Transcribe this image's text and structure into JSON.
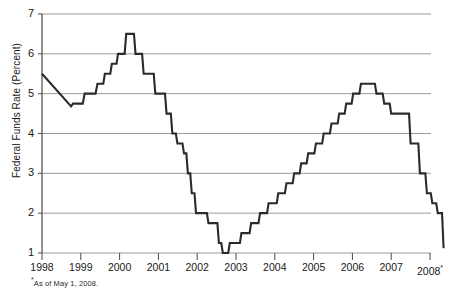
{
  "chart_data": {
    "type": "line",
    "title": "",
    "subtitle": "",
    "xlabel": "",
    "ylabel": "Federal Funds Rate (Percent)",
    "xlim": [
      1998.0,
      2008.35
    ],
    "ylim": [
      1,
      7
    ],
    "ytick_labels": [
      "1",
      "2",
      "3",
      "4",
      "5",
      "6",
      "7"
    ],
    "ytick_values": [
      1,
      2,
      3,
      4,
      5,
      6,
      7
    ],
    "xtick_labels": [
      "1998",
      "1999",
      "2000",
      "2001",
      "2002",
      "2003",
      "2004",
      "2005",
      "2006",
      "2007",
      "2008"
    ],
    "xtick_values": [
      1998,
      1999,
      2000,
      2001,
      2002,
      2003,
      2004,
      2005,
      2006,
      2007,
      2008
    ],
    "xtick_last_superscript": "*",
    "grid": "horizontal",
    "legend": "none",
    "line_color": "#2b2b2b",
    "grid_color": "#9a9a9a",
    "axis_color": "#4a4a4a",
    "background": "#ffffff",
    "step_style": "post",
    "footnote": "As of May 1, 2008.",
    "footnote_marker": "*",
    "series": [
      {
        "name": "Federal Funds Rate",
        "points": [
          {
            "x": 1998.0,
            "y": 5.5
          },
          {
            "x": 1998.75,
            "y": 4.68
          },
          {
            "x": 1998.8,
            "y": 4.75
          },
          {
            "x": 1999.05,
            "y": 4.75
          },
          {
            "x": 1999.1,
            "y": 5.0
          },
          {
            "x": 1999.38,
            "y": 5.0
          },
          {
            "x": 1999.43,
            "y": 5.25
          },
          {
            "x": 1999.58,
            "y": 5.25
          },
          {
            "x": 1999.62,
            "y": 5.5
          },
          {
            "x": 1999.76,
            "y": 5.5
          },
          {
            "x": 1999.8,
            "y": 5.75
          },
          {
            "x": 1999.92,
            "y": 5.75
          },
          {
            "x": 1999.96,
            "y": 6.0
          },
          {
            "x": 2000.13,
            "y": 6.0
          },
          {
            "x": 2000.17,
            "y": 6.5
          },
          {
            "x": 2000.37,
            "y": 6.5
          },
          {
            "x": 2000.41,
            "y": 6.0
          },
          {
            "x": 2000.58,
            "y": 6.0
          },
          {
            "x": 2000.62,
            "y": 5.5
          },
          {
            "x": 2000.88,
            "y": 5.5
          },
          {
            "x": 2000.92,
            "y": 5.0
          },
          {
            "x": 2001.17,
            "y": 5.0
          },
          {
            "x": 2001.21,
            "y": 4.5
          },
          {
            "x": 2001.32,
            "y": 4.5
          },
          {
            "x": 2001.36,
            "y": 4.0
          },
          {
            "x": 2001.45,
            "y": 4.0
          },
          {
            "x": 2001.49,
            "y": 3.75
          },
          {
            "x": 2001.62,
            "y": 3.75
          },
          {
            "x": 2001.66,
            "y": 3.5
          },
          {
            "x": 2001.72,
            "y": 3.5
          },
          {
            "x": 2001.76,
            "y": 3.0
          },
          {
            "x": 2001.82,
            "y": 3.0
          },
          {
            "x": 2001.86,
            "y": 2.5
          },
          {
            "x": 2001.93,
            "y": 2.5
          },
          {
            "x": 2001.97,
            "y": 2.0
          },
          {
            "x": 2002.25,
            "y": 2.0
          },
          {
            "x": 2002.29,
            "y": 1.75
          },
          {
            "x": 2002.52,
            "y": 1.75
          },
          {
            "x": 2002.56,
            "y": 1.25
          },
          {
            "x": 2002.62,
            "y": 1.25
          },
          {
            "x": 2002.66,
            "y": 1.0
          },
          {
            "x": 2002.8,
            "y": 1.0
          },
          {
            "x": 2002.84,
            "y": 1.25
          },
          {
            "x": 2003.1,
            "y": 1.25
          },
          {
            "x": 2003.14,
            "y": 1.5
          },
          {
            "x": 2003.35,
            "y": 1.5
          },
          {
            "x": 2003.39,
            "y": 1.75
          },
          {
            "x": 2003.58,
            "y": 1.75
          },
          {
            "x": 2003.62,
            "y": 2.0
          },
          {
            "x": 2003.8,
            "y": 2.0
          },
          {
            "x": 2003.84,
            "y": 2.25
          },
          {
            "x": 2004.05,
            "y": 2.25
          },
          {
            "x": 2004.09,
            "y": 2.5
          },
          {
            "x": 2004.26,
            "y": 2.5
          },
          {
            "x": 2004.3,
            "y": 2.75
          },
          {
            "x": 2004.46,
            "y": 2.75
          },
          {
            "x": 2004.5,
            "y": 3.0
          },
          {
            "x": 2004.64,
            "y": 3.0
          },
          {
            "x": 2004.68,
            "y": 3.25
          },
          {
            "x": 2004.82,
            "y": 3.25
          },
          {
            "x": 2004.86,
            "y": 3.5
          },
          {
            "x": 2005.02,
            "y": 3.5
          },
          {
            "x": 2005.06,
            "y": 3.75
          },
          {
            "x": 2005.22,
            "y": 3.75
          },
          {
            "x": 2005.26,
            "y": 4.0
          },
          {
            "x": 2005.42,
            "y": 4.0
          },
          {
            "x": 2005.46,
            "y": 4.25
          },
          {
            "x": 2005.62,
            "y": 4.25
          },
          {
            "x": 2005.66,
            "y": 4.5
          },
          {
            "x": 2005.8,
            "y": 4.5
          },
          {
            "x": 2005.84,
            "y": 4.75
          },
          {
            "x": 2005.98,
            "y": 4.75
          },
          {
            "x": 2006.02,
            "y": 5.0
          },
          {
            "x": 2006.18,
            "y": 5.0
          },
          {
            "x": 2006.22,
            "y": 5.25
          },
          {
            "x": 2006.58,
            "y": 5.25
          },
          {
            "x": 2006.62,
            "y": 5.0
          },
          {
            "x": 2006.78,
            "y": 5.0
          },
          {
            "x": 2006.82,
            "y": 4.75
          },
          {
            "x": 2006.96,
            "y": 4.75
          },
          {
            "x": 2007.0,
            "y": 4.5
          },
          {
            "x": 2007.46,
            "y": 4.5
          },
          {
            "x": 2007.5,
            "y": 3.75
          },
          {
            "x": 2007.7,
            "y": 3.75
          },
          {
            "x": 2007.74,
            "y": 3.0
          },
          {
            "x": 2007.88,
            "y": 3.0
          },
          {
            "x": 2007.92,
            "y": 2.5
          },
          {
            "x": 2008.02,
            "y": 2.5
          },
          {
            "x": 2008.06,
            "y": 2.25
          },
          {
            "x": 2008.16,
            "y": 2.25
          },
          {
            "x": 2008.2,
            "y": 2.0
          },
          {
            "x": 2008.31,
            "y": 2.0
          },
          {
            "x": 2008.35,
            "y": 1.12
          }
        ]
      }
    ]
  }
}
